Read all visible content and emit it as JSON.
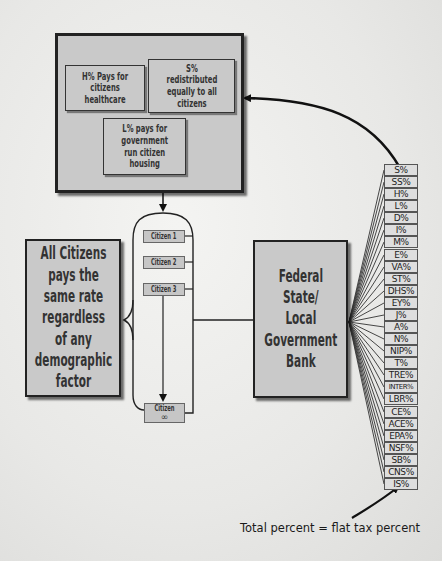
{
  "top_box": {
    "label": "Benefit distribution",
    "items": [
      {
        "text": "H% Pays for\ncitizens\nhealthcare"
      },
      {
        "text": "S%\nredistributed\nequally to all\ncitizens"
      },
      {
        "text": "L% pays for\ngovernment\nrun citizen\nhousing"
      }
    ]
  },
  "left_box": {
    "text": "All Citizens\npays the\nsame rate\nregardless\nof any\ndemographic\nfactor"
  },
  "citizens": [
    {
      "label": "Citizen 1"
    },
    {
      "label": "Citizen 2"
    },
    {
      "label": "Citizen 3"
    },
    {
      "label": "Citizen",
      "sub": "∞"
    }
  ],
  "bank_box": {
    "text": "Federal\nState/\nLocal\nGovernment\nBank"
  },
  "tax_items": [
    "S%",
    "SS%",
    "H%",
    "L%",
    "D%",
    "I%",
    "M%",
    "E%",
    "VA%",
    "ST%",
    "DHS%",
    "EY%",
    "J%",
    "A%",
    "N%",
    "NIP%",
    "T%",
    "TRE%",
    "INTER%",
    "LBR%",
    "CE%",
    "ACE%",
    "EPA%",
    "NSF%",
    "SB%",
    "CNS%",
    "IS%"
  ],
  "caption": "Total percent = flat tax percent",
  "colors": {
    "box_fill": "#c9c9c9",
    "border": "#222222",
    "background": "#eeeeec",
    "text": "#2e2e2e"
  }
}
